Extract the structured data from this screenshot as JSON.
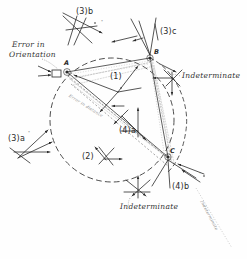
{
  "figure": {
    "background_color": "#fefefe",
    "ink_color": "#2a2a2a",
    "faint_ink_color": "#9a9a9a",
    "width": 247,
    "height": 259
  },
  "points": [
    {
      "id": "A",
      "label": "A",
      "x": 67,
      "y": 72,
      "label_x": 64,
      "label_y": 62
    },
    {
      "id": "B",
      "label": "B",
      "x": 150,
      "y": 58,
      "label_x": 154,
      "label_y": 52
    },
    {
      "id": "C",
      "label": "C",
      "x": 168,
      "y": 157,
      "label_x": 170,
      "label_y": 150
    }
  ],
  "circle": {
    "center_x": 112,
    "center_y": 120,
    "radius": 62,
    "style": "dashed"
  },
  "groups": [
    {
      "id": "g1",
      "label": "(1)",
      "x": 114,
      "y": 78,
      "dot": true
    },
    {
      "id": "g2",
      "label": "(2)",
      "x": 85,
      "y": 158,
      "dot": true
    },
    {
      "id": "g3a",
      "label": "(3)a",
      "x": 10,
      "y": 137,
      "dot": true
    },
    {
      "id": "g3b",
      "label": "(3)b",
      "x": 79,
      "y": 11,
      "dot": true
    },
    {
      "id": "g3c",
      "label": "(3)c",
      "x": 163,
      "y": 30,
      "dot": true
    },
    {
      "id": "g4a",
      "label": "(4)a",
      "x": 122,
      "y": 131,
      "dot": true
    },
    {
      "id": "g4b",
      "label": "(4)b",
      "x": 175,
      "y": 186,
      "dot": true
    }
  ],
  "annotations": [
    {
      "id": "error-orientation",
      "text": "Error in",
      "x": 12,
      "y": 46
    },
    {
      "id": "error-orientation-2",
      "text": "Orientation",
      "x": 9,
      "y": 55
    },
    {
      "id": "indeterminate-right",
      "text": "Indeterminate",
      "x": 182,
      "y": 76
    },
    {
      "id": "indeterminate-bottom",
      "text": "Indeterminate",
      "x": 120,
      "y": 207
    }
  ],
  "faint_annotations": [
    {
      "id": "ray-note-a",
      "text": "Error in distance",
      "x": 72,
      "y": 96,
      "rotate": 32
    },
    {
      "id": "ray-note-b",
      "text": "Indeterminate",
      "x": 206,
      "y": 204,
      "rotate": 62
    }
  ],
  "legend_note": {
    "dot_marker": "°"
  }
}
